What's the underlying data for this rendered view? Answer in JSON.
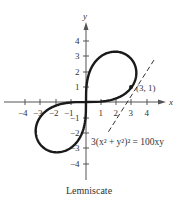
{
  "figure": {
    "caption": "Lemniscate",
    "equation": "3(x² + y²)² = 100xy",
    "point_label": "(3, 1)",
    "axes": {
      "x_label": "x",
      "y_label": "y",
      "x_ticks": [
        "−4",
        "−3",
        "−2",
        "−1",
        "1",
        "2",
        "3",
        "4"
      ],
      "y_ticks": [
        "4",
        "3",
        "2",
        "1",
        "−1",
        "−2",
        "−3",
        "−4"
      ]
    },
    "colors": {
      "curve": "#1a1a1a",
      "axis": "#555555",
      "text": "#333333",
      "background": "#ffffff"
    }
  },
  "chart_data": {
    "type": "line",
    "title": "Lemniscate",
    "equation": "3(x^2 + y^2)^2 = 100xy",
    "polar_form": "r^2 = (50/3) sin(2θ)",
    "xlabel": "x",
    "ylabel": "y",
    "xlim": [
      -4.5,
      5
    ],
    "ylim": [
      -5,
      5
    ],
    "x_ticks": [
      -4,
      -3,
      -2,
      -1,
      1,
      2,
      3,
      4
    ],
    "y_ticks": [
      -4,
      -3,
      -2,
      -1,
      1,
      2,
      3,
      4
    ],
    "grid": false,
    "highlighted_point": {
      "x": 3,
      "y": 1,
      "label": "(3, 1)"
    },
    "tangent_line": {
      "style": "dashed",
      "through": [
        3,
        1
      ],
      "approx_slope": 1.35
    },
    "series": [
      {
        "name": "lemniscate",
        "style": "solid",
        "points": [
          [
            0,
            0
          ],
          [
            1.44,
            0.6
          ],
          [
            2.3,
            1.0
          ],
          [
            3,
            1
          ],
          [
            3.3,
            1.5
          ],
          [
            3.5,
            2.3
          ],
          [
            3.2,
            3.0
          ],
          [
            2.6,
            3.2
          ],
          [
            1.8,
            3.0
          ],
          [
            1.0,
            2.3
          ],
          [
            0.4,
            1.3
          ],
          [
            0,
            0
          ],
          [
            -0.4,
            -1.3
          ],
          [
            -1.0,
            -2.3
          ],
          [
            -1.8,
            -3.0
          ],
          [
            -2.6,
            -3.2
          ],
          [
            -3.2,
            -3.0
          ],
          [
            -3.5,
            -2.3
          ],
          [
            -3.3,
            -1.5
          ],
          [
            -3,
            -1
          ],
          [
            -2.3,
            -1.0
          ],
          [
            -1.44,
            -0.6
          ],
          [
            0,
            0
          ]
        ]
      }
    ]
  }
}
